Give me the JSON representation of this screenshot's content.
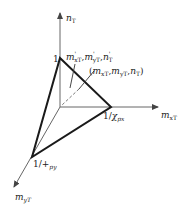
{
  "diagram": {
    "type": "3d-axis-interaction-surface",
    "axes": {
      "vertical": {
        "label": "n",
        "sub": "T"
      },
      "horizontal": {
        "label": "m",
        "sub": "xT"
      },
      "depth": {
        "label": "m",
        "sub": "yT"
      }
    },
    "intercepts": {
      "vertical": "1",
      "horizontal_prefix": "1/",
      "horizontal_sym": "χ",
      "horizontal_sub": "px",
      "depth_prefix": "1/",
      "depth_sym": "+",
      "depth_sub": "py"
    },
    "annotations": {
      "surface_point_primed": {
        "m1": "m",
        "s1": "xT",
        "m2": "m",
        "s2": "yT",
        "m3": "n",
        "s3": "T",
        "prime": "'"
      },
      "load_point": {
        "open": "(",
        "m1": "m",
        "s1": "xT",
        "m2": "m",
        "s2": "yT",
        "m3": "n",
        "s3": "T",
        "close": ")"
      }
    },
    "colors": {
      "axis": "#555555",
      "surface_edge": "#1a1a1a"
    }
  }
}
